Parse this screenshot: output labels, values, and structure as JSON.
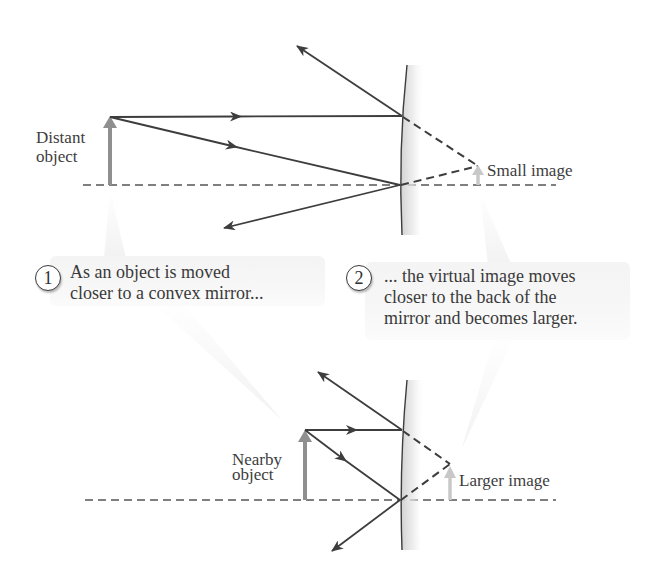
{
  "diagram": {
    "colors": {
      "ray": "#3d3d3d",
      "object_arrow": "#8f8f8f",
      "image_arrow": "#c8c8c8",
      "axis": "#555555",
      "callout_bg": "#f5f5f5",
      "mirror_shade": "#d9d9d9"
    },
    "top_panel": {
      "object_label_line1": "Distant",
      "object_label_line2": "object",
      "image_label": "Small image"
    },
    "bottom_panel": {
      "object_label_line1": "Nearby",
      "object_label_line2": "object",
      "image_label": "Larger image"
    },
    "callouts": [
      {
        "step": "1",
        "line1": "As an object is moved",
        "line2": "closer to a convex mirror..."
      },
      {
        "step": "2",
        "line1": "... the virtual image moves",
        "line2": "closer to the back of the",
        "line3": "mirror and becomes larger."
      }
    ]
  }
}
